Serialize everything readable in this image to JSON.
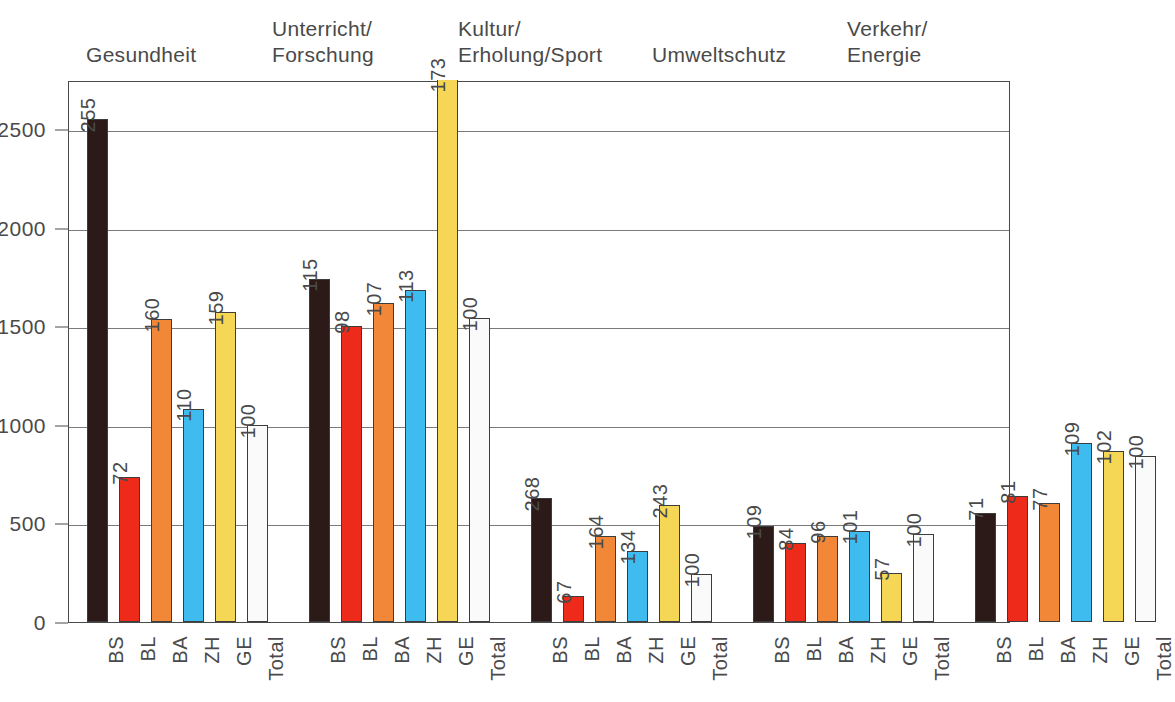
{
  "chart_data": {
    "type": "bar",
    "title": "",
    "subtitle": "",
    "xlabel": "",
    "ylabel": "",
    "ylim": [
      0,
      2750
    ],
    "grid": true,
    "legend_position": "none",
    "y_ticks": [
      0,
      500,
      1000,
      1500,
      2000,
      2500
    ],
    "y_tick_labels": [
      "0",
      "500",
      "1000",
      "1500",
      "2000",
      "2500"
    ],
    "categories": [
      "BS",
      "BL",
      "BA",
      "ZH",
      "GE",
      "Total"
    ],
    "series_colors": {
      "BS": "#2B1A17",
      "BL": "#EE2B1B",
      "BA": "#F28738",
      "ZH": "#3FBCEF",
      "GE": "#F5D755",
      "Total": "#FAFAFA"
    },
    "groups": [
      {
        "name": "Gesundheit",
        "title_lines": [
          "Gesundheit"
        ],
        "bars": [
          {
            "category": "BS",
            "label": "255",
            "value": 2550,
            "color": "#2B1A17",
            "clipped": false
          },
          {
            "category": "BL",
            "label": "72",
            "value": 735,
            "color": "#EE2B1B",
            "clipped": false
          },
          {
            "category": "BA",
            "label": "160",
            "value": 1535,
            "color": "#F28738",
            "clipped": false
          },
          {
            "category": "ZH",
            "label": "110",
            "value": 1080,
            "color": "#3FBCEF",
            "clipped": false
          },
          {
            "category": "GE",
            "label": "159",
            "value": 1575,
            "color": "#F5D755",
            "clipped": false
          },
          {
            "category": "Total",
            "label": "100",
            "value": 1000,
            "color": "#FAFAFA",
            "clipped": false
          }
        ]
      },
      {
        "name": "Unterricht/Forschung",
        "title_lines": [
          "Unterricht/",
          "Forschung"
        ],
        "bars": [
          {
            "category": "BS",
            "label": "115",
            "value": 1740,
            "color": "#2B1A17",
            "clipped": false
          },
          {
            "category": "BL",
            "label": "98",
            "value": 1500,
            "color": "#EE2B1B",
            "clipped": false
          },
          {
            "category": "BA",
            "label": "107",
            "value": 1620,
            "color": "#F28738",
            "clipped": false
          },
          {
            "category": "ZH",
            "label": "113",
            "value": 1685,
            "color": "#3FBCEF",
            "clipped": false
          },
          {
            "category": "GE",
            "label": "173",
            "value": 2750,
            "color": "#F5D755",
            "clipped": true
          },
          {
            "category": "Total",
            "label": "100",
            "value": 1540,
            "color": "#FAFAFA",
            "clipped": false
          }
        ]
      },
      {
        "name": "Kultur/Erholung/Sport",
        "title_lines": [
          "Kultur/",
          "Erholung/Sport"
        ],
        "bars": [
          {
            "category": "BS",
            "label": "268",
            "value": 630,
            "color": "#2B1A17",
            "clipped": false
          },
          {
            "category": "BL",
            "label": "67",
            "value": 130,
            "color": "#EE2B1B",
            "clipped": false
          },
          {
            "category": "BA",
            "label": "164",
            "value": 435,
            "color": "#F28738",
            "clipped": false
          },
          {
            "category": "ZH",
            "label": "134",
            "value": 360,
            "color": "#3FBCEF",
            "clipped": false
          },
          {
            "category": "GE",
            "label": "243",
            "value": 595,
            "color": "#F5D755",
            "clipped": false
          },
          {
            "category": "Total",
            "label": "100",
            "value": 245,
            "color": "#FAFAFA",
            "clipped": false
          }
        ]
      },
      {
        "name": "Umweltschutz",
        "title_lines": [
          "Umweltschutz"
        ],
        "bars": [
          {
            "category": "BS",
            "label": "109",
            "value": 485,
            "color": "#2B1A17",
            "clipped": false
          },
          {
            "category": "BL",
            "label": "84",
            "value": 400,
            "color": "#EE2B1B",
            "clipped": false
          },
          {
            "category": "BA",
            "label": "96",
            "value": 435,
            "color": "#F28738",
            "clipped": false
          },
          {
            "category": "ZH",
            "label": "101",
            "value": 460,
            "color": "#3FBCEF",
            "clipped": false
          },
          {
            "category": "GE",
            "label": "57",
            "value": 250,
            "color": "#F5D755",
            "clipped": false
          },
          {
            "category": "Total",
            "label": "100",
            "value": 445,
            "color": "#FAFAFA",
            "clipped": false
          }
        ]
      },
      {
        "name": "Verkehr/Energie",
        "title_lines": [
          "Verkehr/",
          "Energie"
        ],
        "bars": [
          {
            "category": "BS",
            "label": "71",
            "value": 555,
            "color": "#2B1A17",
            "clipped": false
          },
          {
            "category": "BL",
            "label": "81",
            "value": 640,
            "color": "#EE2B1B",
            "clipped": false
          },
          {
            "category": "BA",
            "label": "77",
            "value": 605,
            "color": "#F28738",
            "clipped": false
          },
          {
            "category": "ZH",
            "label": "109",
            "value": 910,
            "color": "#3FBCEF",
            "clipped": false
          },
          {
            "category": "GE",
            "label": "102",
            "value": 870,
            "color": "#F5D755",
            "clipped": false
          },
          {
            "category": "Total",
            "label": "100",
            "value": 840,
            "color": "#FAFAFA",
            "clipped": false
          }
        ]
      }
    ]
  },
  "layout": {
    "plot_left": 68,
    "plot_top": 81,
    "plot_width": 942,
    "plot_height": 542,
    "group_title_positions": [
      {
        "left": 86,
        "top": 42
      },
      {
        "left": 272,
        "top": 16
      },
      {
        "left": 458,
        "top": 16
      },
      {
        "left": 652,
        "top": 42
      },
      {
        "left": 847,
        "top": 16
      }
    ]
  }
}
